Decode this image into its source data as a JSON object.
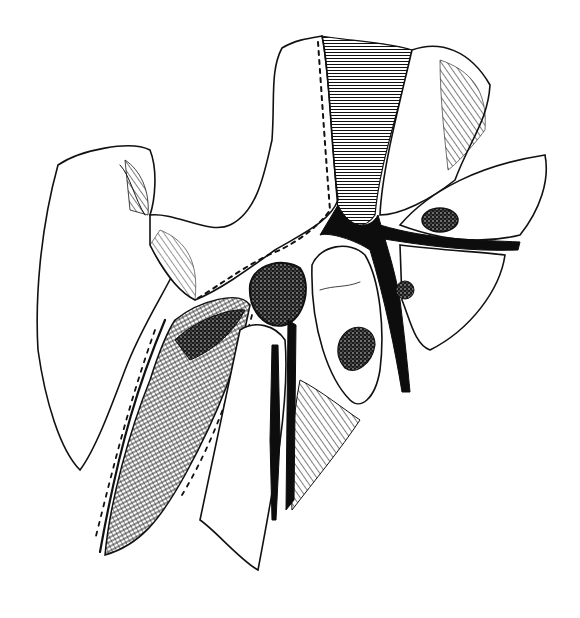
{
  "figure": {
    "kind": "anatomical engraving",
    "style": "black and white line illustration with stippling and hatching",
    "background_color": "#ffffff",
    "ink_color": "#111111",
    "labels": []
  }
}
